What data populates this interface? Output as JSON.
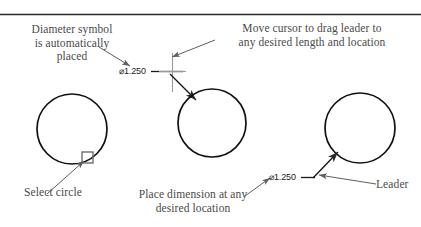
{
  "figure": {
    "title_rule_color": "#2b2b2b",
    "line_color": "#111111",
    "text_color": "#4a4a4a",
    "cursor_color": "#8a8a8a",
    "marker_color": "#6e6e6e"
  },
  "annotations": {
    "diameter_symbol": "Diameter symbol\nis automatically\nplaced",
    "move_cursor": "Move cursor to drag leader to\nany desired length and location",
    "select_circle": "Select circle",
    "place_dimension": "Place dimension at any\ndesired location",
    "leader": "Leader"
  },
  "dimensions": {
    "middle_value": "⌀0.250",
    "middle_label": "⌀1.250",
    "right_label": "⌀1.250"
  },
  "steps": [
    {
      "name": "step-1-select-circle",
      "circle": {
        "cx": 72,
        "cy": 129,
        "r": 35
      },
      "marker": {
        "x": 82,
        "y": 152,
        "size": 11
      }
    },
    {
      "name": "step-2-drag-leader",
      "circle": {
        "cx": 212,
        "cy": 123,
        "r": 34
      },
      "cursor": {
        "x": 172,
        "y": 71,
        "arm": 13
      }
    },
    {
      "name": "step-3-place-dimension",
      "circle": {
        "cx": 360,
        "cy": 128,
        "r": 35
      }
    }
  ]
}
